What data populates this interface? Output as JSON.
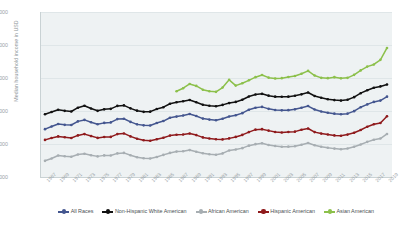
{
  "chart_data": {
    "type": "line",
    "title": "",
    "xlabel": "",
    "ylabel": "Median household income in USD",
    "ylim": [
      20000,
      120000
    ],
    "yticks": [
      "20,000",
      "40,000",
      "60,000",
      "80,000",
      "100,000",
      "120,000"
    ],
    "ytick_values": [
      20000,
      40000,
      60000,
      80000,
      100000,
      120000
    ],
    "grid": true,
    "legend_position": "bottom",
    "x": [
      1967,
      1968,
      1969,
      1970,
      1971,
      1972,
      1973,
      1974,
      1975,
      1976,
      1977,
      1978,
      1979,
      1980,
      1981,
      1982,
      1983,
      1984,
      1985,
      1986,
      1987,
      1988,
      1989,
      1990,
      1991,
      1992,
      1993,
      1994,
      1995,
      1996,
      1997,
      1998,
      1999,
      2000,
      2001,
      2002,
      2003,
      2004,
      2005,
      2006,
      2007,
      2008,
      2009,
      2010,
      2011,
      2012,
      2013,
      2014,
      2015,
      2016,
      2017,
      2018,
      2019
    ],
    "xtick_labels": [
      "1967",
      "1969",
      "1971",
      "1973",
      "1975",
      "1977",
      "1979",
      "1981",
      "1983",
      "1985",
      "1987",
      "1989",
      "1991",
      "1993",
      "1995",
      "1997",
      "1999",
      "2001",
      "2003",
      "2005",
      "2007",
      "2009",
      "2011",
      "2013",
      "2015",
      "2017",
      "2019"
    ],
    "series": [
      {
        "name": "All Races",
        "color": "#44568f",
        "values": [
          49000,
          50600,
          52100,
          51600,
          51500,
          53700,
          54600,
          53200,
          52000,
          52800,
          53100,
          55100,
          55300,
          53400,
          51900,
          51300,
          51200,
          52700,
          53900,
          55900,
          56600,
          57300,
          58200,
          57000,
          55400,
          54800,
          54400,
          55300,
          56700,
          57400,
          58700,
          60800,
          62000,
          62500,
          61300,
          60600,
          60400,
          60500,
          61000,
          62000,
          63000,
          60900,
          59700,
          58900,
          58400,
          58000,
          58400,
          59900,
          62300,
          64000,
          65500,
          66300,
          68700
        ]
      },
      {
        "name": "Non-Hispanic White American",
        "color": "#111111",
        "values": [
          58000,
          59400,
          60800,
          60100,
          59700,
          62000,
          63200,
          61500,
          60100,
          61000,
          61300,
          63100,
          63400,
          61600,
          60200,
          59500,
          59600,
          61200,
          62300,
          64400,
          65300,
          65900,
          66700,
          65300,
          63800,
          63200,
          62900,
          63700,
          64800,
          65500,
          66800,
          68800,
          70000,
          70400,
          69300,
          68700,
          68600,
          68700,
          69200,
          70100,
          71200,
          69100,
          68000,
          67100,
          66600,
          66300,
          66800,
          68400,
          70800,
          72600,
          74100,
          74900,
          76100
        ]
      },
      {
        "name": "African American",
        "color": "#a7aeb2",
        "values": [
          29800,
          31200,
          33000,
          32600,
          32300,
          33600,
          34100,
          33200,
          32500,
          33100,
          33000,
          34300,
          34600,
          33200,
          32000,
          31400,
          31200,
          32100,
          33400,
          34600,
          35400,
          35600,
          36300,
          35300,
          34400,
          33800,
          33500,
          34300,
          36100,
          36700,
          37500,
          39000,
          39900,
          40500,
          39400,
          38800,
          38300,
          38400,
          38600,
          39500,
          40600,
          39200,
          38300,
          37700,
          37200,
          36800,
          37300,
          38300,
          39700,
          41300,
          42600,
          43300,
          46100
        ]
      },
      {
        "name": "Hispanic American",
        "color": "#8f1a1c",
        "values": [
          42500,
          43600,
          44600,
          44100,
          43600,
          45200,
          46000,
          44800,
          43700,
          44200,
          44300,
          46000,
          46400,
          44600,
          43200,
          42300,
          42000,
          42900,
          43800,
          45100,
          45600,
          45800,
          46400,
          45400,
          44000,
          43300,
          42900,
          42800,
          43400,
          44300,
          45500,
          47200,
          48700,
          49000,
          48100,
          47300,
          47000,
          47300,
          47500,
          48600,
          49400,
          47200,
          46300,
          45800,
          45200,
          45000,
          45700,
          46800,
          48500,
          50500,
          52000,
          52700,
          56800
        ]
      },
      {
        "name": "Asian American",
        "color": "#8cc04b",
        "values": [
          null,
          null,
          null,
          null,
          null,
          null,
          null,
          null,
          null,
          null,
          null,
          null,
          null,
          null,
          null,
          null,
          null,
          null,
          null,
          null,
          72000,
          73800,
          76400,
          75200,
          72900,
          72000,
          71600,
          74200,
          78900,
          75400,
          76800,
          78600,
          80500,
          81800,
          80200,
          79700,
          79900,
          80600,
          81200,
          82600,
          84300,
          81500,
          80100,
          79900,
          80500,
          79800,
          80100,
          81900,
          84600,
          86900,
          88200,
          91000,
          98200
        ]
      }
    ]
  },
  "legend": {
    "items": [
      {
        "label": "All Races",
        "color": "#44568f"
      },
      {
        "label": "Non-Hispanic White American",
        "color": "#111111"
      },
      {
        "label": "African American",
        "color": "#a7aeb2"
      },
      {
        "label": "Hispanic American",
        "color": "#8f1a1c"
      },
      {
        "label": "Asian American",
        "color": "#8cc04b"
      }
    ]
  }
}
